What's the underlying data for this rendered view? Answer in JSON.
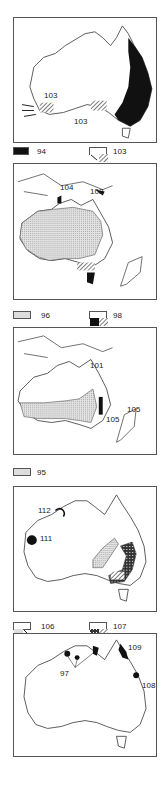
{
  "figure": {
    "panels": [
      {
        "id": "panel-1",
        "labels": [
          {
            "text": "103",
            "pos": "west"
          },
          {
            "text": "103",
            "pos": "south"
          }
        ],
        "legend": [
          {
            "pattern": "solid-black",
            "text": "94"
          },
          {
            "pattern": "arrow-and-hatch",
            "text": "103"
          }
        ]
      },
      {
        "id": "panel-2",
        "labels": [
          {
            "text": "104",
            "pos": "north"
          },
          {
            "text": "102",
            "pos": "north-east"
          }
        ],
        "legend": [
          {
            "pattern": "stipple-and-line",
            "text": "96"
          },
          {
            "pattern": "black-and-hatch",
            "text": "98"
          }
        ]
      },
      {
        "id": "panel-3",
        "labels": [
          {
            "text": "101",
            "pos": "north-east"
          },
          {
            "text": "105",
            "pos": "east"
          },
          {
            "text": "105",
            "pos": "new-zealand"
          }
        ],
        "legend": [
          {
            "pattern": "stipple",
            "text": "95"
          }
        ]
      },
      {
        "id": "panel-4",
        "labels": [
          {
            "text": "112",
            "pos": "north-west"
          },
          {
            "text": "111",
            "pos": "west"
          }
        ],
        "legend": [
          {
            "pattern": "stipple-and-hatch",
            "text": "106"
          },
          {
            "pattern": "crosshatch-and-hatch",
            "text": "107"
          }
        ]
      },
      {
        "id": "panel-5",
        "labels": [
          {
            "text": "97",
            "pos": "north"
          },
          {
            "text": "109",
            "pos": "north-east"
          },
          {
            "text": "108",
            "pos": "east"
          }
        ],
        "legend": []
      }
    ]
  }
}
